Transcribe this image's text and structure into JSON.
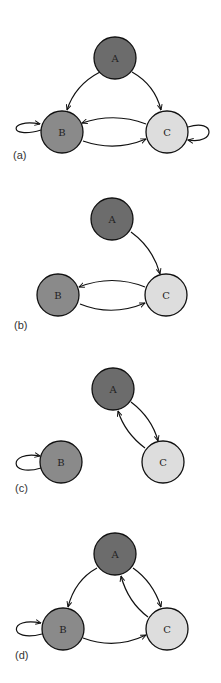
{
  "colors": {
    "A": "#6c6c6c",
    "B": "#8a8a8a",
    "C": "#dddddd",
    "stroke": "#111111"
  },
  "panels": [
    {
      "label": "(a)",
      "nodes": {
        "A": "A",
        "B": "B",
        "C": "C"
      },
      "edges": [
        "A->B",
        "A->C",
        "B->C",
        "C->B",
        "B->B",
        "C->C"
      ]
    },
    {
      "label": "(b)",
      "nodes": {
        "A": "A",
        "B": "B",
        "C": "C"
      },
      "edges": [
        "A->C",
        "B->C",
        "C->B"
      ]
    },
    {
      "label": "(c)",
      "nodes": {
        "A": "A",
        "B": "B",
        "C": "C"
      },
      "edges": [
        "B->B",
        "A->C",
        "C->A"
      ]
    },
    {
      "label": "(d)",
      "nodes": {
        "A": "A",
        "B": "B",
        "C": "C"
      },
      "edges": [
        "A->B",
        "A->C",
        "C->A",
        "B->C",
        "B->B"
      ]
    }
  ]
}
